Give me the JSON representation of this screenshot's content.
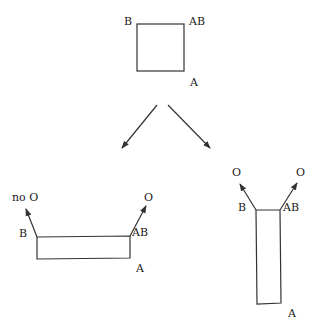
{
  "diagram": {
    "top": {
      "labels": {
        "top_left": "B",
        "top_right": "AB",
        "bottom_right": "A"
      }
    },
    "bottom_left": {
      "labels": {
        "top_left": "B",
        "top_right": "AB",
        "bottom_right": "A"
      },
      "arrow_labels": {
        "left": "no O",
        "right": "O"
      }
    },
    "bottom_right": {
      "labels": {
        "top_left": "B",
        "top_right": "AB",
        "bottom_right": "A"
      },
      "arrow_labels": {
        "left": "O",
        "right": "O"
      }
    },
    "colors": {
      "stroke": "#333333",
      "text": "#1a1a1a",
      "background": "#ffffff"
    }
  }
}
